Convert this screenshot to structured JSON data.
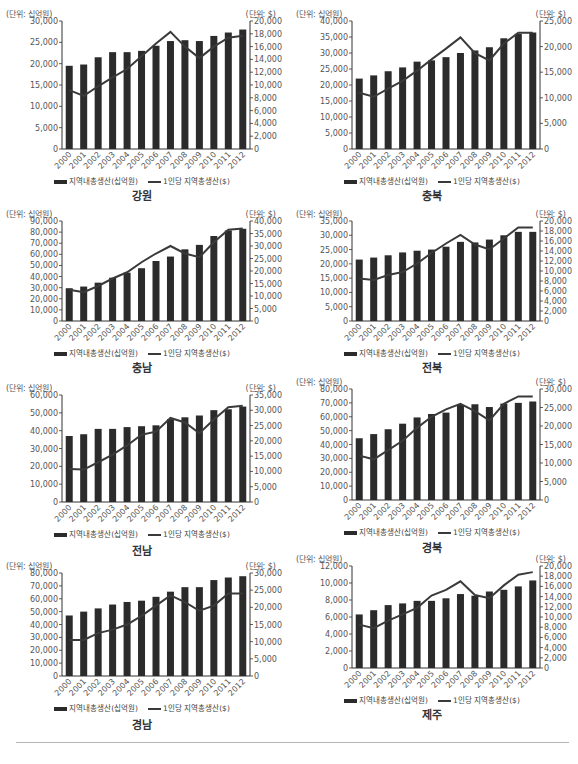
{
  "legend": {
    "bar_label": "지역내총생산(십억원)",
    "line_label": "1인당 지역총생산($)"
  },
  "units": {
    "left": "(단위: 십억원)",
    "right": "(단위: $)"
  },
  "colors": {
    "bar": "#2b2b2b",
    "line": "#3a3a3a",
    "axis": "#333333",
    "text": "#555555"
  },
  "chart_data": [
    {
      "type": "bar+line",
      "title": "강원",
      "categories": [
        "2000",
        "2001",
        "2002",
        "2003",
        "2004",
        "2005",
        "2006",
        "2007",
        "2008",
        "2009",
        "2010",
        "2011",
        "2012"
      ],
      "left_axis": {
        "label": "(단위: 십억원)",
        "ylim": [
          0,
          30000
        ],
        "ticks": [
          0,
          5000,
          10000,
          15000,
          20000,
          25000,
          30000
        ]
      },
      "right_axis": {
        "label": "(단위: $)",
        "ylim": [
          0,
          20000
        ],
        "ticks": [
          0,
          2000,
          4000,
          6000,
          8000,
          10000,
          12000,
          14000,
          16000,
          18000,
          20000
        ]
      },
      "series": [
        {
          "name": "지역내총생산(십억원)",
          "type": "bar",
          "axis": "left",
          "values": [
            19500,
            19800,
            21500,
            22700,
            22700,
            23000,
            24200,
            25300,
            25500,
            25300,
            26500,
            27300,
            28000
          ]
        },
        {
          "name": "1인당 지역총생산($)",
          "type": "line",
          "axis": "right",
          "values": [
            9200,
            8300,
            9800,
            11200,
            12500,
            14500,
            16500,
            18300,
            16000,
            14200,
            16000,
            17400,
            17700
          ]
        }
      ]
    },
    {
      "type": "bar+line",
      "title": "충북",
      "categories": [
        "2000",
        "2001",
        "2002",
        "2003",
        "2004",
        "2005",
        "2006",
        "2007",
        "2008",
        "2009",
        "2010",
        "2011",
        "2012"
      ],
      "left_axis": {
        "label": "(단위: 십억원)",
        "ylim": [
          0,
          40000
        ],
        "ticks": [
          0,
          5000,
          10000,
          15000,
          20000,
          25000,
          30000,
          35000,
          40000
        ]
      },
      "right_axis": {
        "label": "(단위: $)",
        "ylim": [
          0,
          25000
        ],
        "ticks": [
          0,
          5000,
          10000,
          15000,
          20000,
          25000
        ]
      },
      "series": [
        {
          "name": "지역내총생산(십억원)",
          "type": "bar",
          "axis": "left",
          "values": [
            22000,
            23000,
            24300,
            25500,
            27300,
            27700,
            28700,
            30000,
            30800,
            31800,
            34600,
            36000,
            36400
          ]
        },
        {
          "name": "1인당 지역총생산($)",
          "type": "line",
          "axis": "right",
          "values": [
            11000,
            10200,
            11800,
            13300,
            15300,
            17500,
            19600,
            21800,
            18700,
            17300,
            20600,
            22700,
            22700
          ]
        }
      ]
    },
    {
      "type": "bar+line",
      "title": "충남",
      "categories": [
        "2000",
        "2001",
        "2002",
        "2003",
        "2004",
        "2005",
        "2006",
        "2007",
        "2008",
        "2009",
        "2010",
        "2011",
        "2012"
      ],
      "left_axis": {
        "label": "(단위: 십억원)",
        "ylim": [
          0,
          90000
        ],
        "ticks": [
          0,
          10000,
          20000,
          30000,
          40000,
          50000,
          60000,
          70000,
          80000,
          90000
        ]
      },
      "right_axis": {
        "label": "(단위: $)",
        "ylim": [
          0,
          40000
        ],
        "ticks": [
          0,
          5000,
          10000,
          15000,
          20000,
          25000,
          30000,
          35000,
          40000
        ]
      },
      "series": [
        {
          "name": "지역내총생산(십억원)",
          "type": "bar",
          "axis": "left",
          "values": [
            29500,
            31000,
            34500,
            39000,
            43500,
            47500,
            54000,
            58000,
            64500,
            68500,
            76500,
            81500,
            83000
          ]
        },
        {
          "name": "1인당 지역총생산($)",
          "type": "line",
          "axis": "right",
          "values": [
            12500,
            11500,
            14000,
            17000,
            19500,
            23500,
            27000,
            30000,
            27000,
            25500,
            31500,
            36500,
            37000
          ]
        }
      ]
    },
    {
      "type": "bar+line",
      "title": "전북",
      "categories": [
        "2000",
        "2001",
        "2002",
        "2003",
        "2004",
        "2005",
        "2006",
        "2007",
        "2008",
        "2009",
        "2010",
        "2011",
        "2012"
      ],
      "left_axis": {
        "label": "(단위: 십억원)",
        "ylim": [
          0,
          35000
        ],
        "ticks": [
          0,
          5000,
          10000,
          15000,
          20000,
          25000,
          30000,
          35000
        ]
      },
      "right_axis": {
        "label": "(단위: $)",
        "ylim": [
          0,
          20000
        ],
        "ticks": [
          0,
          2000,
          4000,
          6000,
          8000,
          10000,
          12000,
          14000,
          16000,
          18000,
          20000
        ]
      },
      "series": [
        {
          "name": "지역내총생산(십억원)",
          "type": "bar",
          "axis": "left",
          "values": [
            21500,
            22200,
            23000,
            24000,
            24600,
            25000,
            26000,
            27700,
            27500,
            28500,
            30000,
            31200,
            31200
          ]
        },
        {
          "name": "1인당 지역총생산($)",
          "type": "line",
          "axis": "right",
          "values": [
            8500,
            8200,
            9200,
            9800,
            11500,
            13600,
            15500,
            17200,
            15300,
            14300,
            16500,
            18700,
            18700
          ]
        }
      ]
    },
    {
      "type": "bar+line",
      "title": "전남",
      "categories": [
        "2000",
        "2001",
        "2002",
        "2003",
        "2004",
        "2005",
        "2006",
        "2007",
        "2008",
        "2009",
        "2010",
        "2011",
        "2012"
      ],
      "left_axis": {
        "label": "(단위: 십억원)",
        "ylim": [
          0,
          60000
        ],
        "ticks": [
          0,
          10000,
          20000,
          30000,
          40000,
          50000,
          60000
        ]
      },
      "right_axis": {
        "label": "(단위: $)",
        "ylim": [
          0,
          35000
        ],
        "ticks": [
          0,
          5000,
          10000,
          15000,
          20000,
          25000,
          30000,
          35000
        ]
      },
      "series": [
        {
          "name": "지역내총생산(십억원)",
          "type": "bar",
          "axis": "left",
          "values": [
            37000,
            38000,
            41000,
            41000,
            42000,
            42500,
            43000,
            46500,
            47500,
            48500,
            51500,
            52000,
            53500
          ]
        },
        {
          "name": "1인당 지역총생산($)",
          "type": "line",
          "axis": "right",
          "values": [
            10800,
            10600,
            13000,
            15500,
            18500,
            22000,
            23000,
            27500,
            26000,
            22500,
            27000,
            31000,
            31500
          ]
        }
      ]
    },
    {
      "type": "bar+line",
      "title": "경북",
      "categories": [
        "2000",
        "2001",
        "2002",
        "2003",
        "2004",
        "2005",
        "2006",
        "2007",
        "2008",
        "2009",
        "2010",
        "2011",
        "2012"
      ],
      "left_axis": {
        "label": "(단위: 십억원)",
        "ylim": [
          0,
          80000
        ],
        "ticks": [
          0,
          10000,
          20000,
          30000,
          40000,
          50000,
          60000,
          70000,
          80000
        ]
      },
      "right_axis": {
        "label": "(단위: $)",
        "ylim": [
          0,
          30000
        ],
        "ticks": [
          0,
          5000,
          10000,
          15000,
          20000,
          25000,
          30000
        ]
      },
      "series": [
        {
          "name": "지역내총생산(십억원)",
          "type": "bar",
          "axis": "left",
          "values": [
            44500,
            47500,
            51000,
            55000,
            59500,
            62000,
            63000,
            68500,
            69000,
            67000,
            69500,
            70000,
            71000
          ]
        },
        {
          "name": "1인당 지역총생산($)",
          "type": "line",
          "axis": "right",
          "values": [
            12000,
            11000,
            13500,
            16000,
            19500,
            22500,
            24500,
            26000,
            24000,
            21500,
            26000,
            28000,
            28000
          ]
        }
      ]
    },
    {
      "type": "bar+line",
      "title": "경남",
      "categories": [
        "2000",
        "2001",
        "2002",
        "2003",
        "2004",
        "2005",
        "2006",
        "2007",
        "2008",
        "2009",
        "2010",
        "2011",
        "2012"
      ],
      "left_axis": {
        "label": "(단위: 십억원)",
        "ylim": [
          0,
          80000
        ],
        "ticks": [
          0,
          10000,
          20000,
          30000,
          40000,
          50000,
          60000,
          70000,
          80000
        ]
      },
      "right_axis": {
        "label": "(단위: $)",
        "ylim": [
          0,
          30000
        ],
        "ticks": [
          0,
          5000,
          10000,
          15000,
          20000,
          25000,
          30000
        ]
      },
      "series": [
        {
          "name": "지역내총생산(십억원)",
          "type": "bar",
          "axis": "left",
          "values": [
            47000,
            50000,
            52500,
            55500,
            57500,
            58500,
            61500,
            65500,
            69000,
            69000,
            74500,
            76500,
            77500
          ]
        },
        {
          "name": "1인당 지역총생산($)",
          "type": "line",
          "axis": "right",
          "values": [
            10500,
            10500,
            12500,
            13500,
            15000,
            17500,
            20500,
            23500,
            21500,
            19000,
            20500,
            24000,
            24000
          ]
        }
      ]
    },
    {
      "type": "bar+line",
      "title": "제주",
      "categories": [
        "2000",
        "2001",
        "2002",
        "2003",
        "2004",
        "2005",
        "2006",
        "2007",
        "2008",
        "2009",
        "2010",
        "2011",
        "2012"
      ],
      "left_axis": {
        "label": "(단위: 십억원)",
        "ylim": [
          0,
          12000
        ],
        "ticks": [
          0,
          2000,
          4000,
          6000,
          8000,
          10000,
          12000
        ]
      },
      "right_axis": {
        "label": "(단위: $)",
        "ylim": [
          0,
          20000
        ],
        "ticks": [
          0,
          2000,
          4000,
          6000,
          8000,
          10000,
          12000,
          14000,
          16000,
          18000,
          20000
        ]
      },
      "series": [
        {
          "name": "지역내총생산(십억원)",
          "type": "bar",
          "axis": "left",
          "values": [
            6300,
            6800,
            7400,
            7600,
            7900,
            7900,
            8200,
            8700,
            8500,
            9000,
            9200,
            9600,
            10300
          ]
        },
        {
          "name": "1인당 지역총생산($)",
          "type": "line",
          "axis": "right",
          "values": [
            8500,
            7800,
            9300,
            10500,
            11800,
            14200,
            15300,
            17000,
            14300,
            13700,
            16200,
            18300,
            18800
          ]
        }
      ]
    }
  ]
}
